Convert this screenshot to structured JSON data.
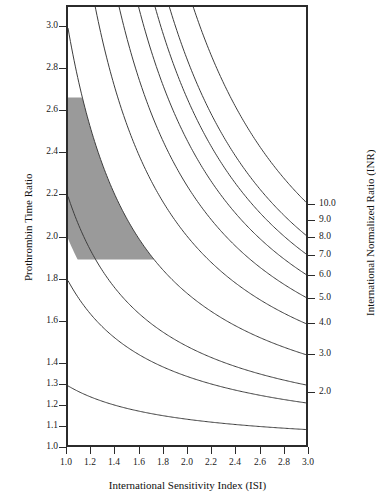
{
  "chart_data": {
    "type": "line",
    "title": "",
    "xlabel": "International Sensitivity Index (ISI)",
    "ylabel": "Prothrombin Time Ratio",
    "y2label": "International Normalized Ratio (INR)",
    "xlim": [
      1.0,
      3.0
    ],
    "ylim": [
      1.0,
      3.1
    ],
    "grid": false,
    "legend": "none",
    "x_ticks": [
      "1.0",
      "1.2",
      "1.4",
      "1.6",
      "1.8",
      "2.0",
      "2.2",
      "2.4",
      "2.6",
      "2.8",
      "3.0"
    ],
    "x_tick_values": [
      1.0,
      1.2,
      1.4,
      1.6,
      1.8,
      2.0,
      2.2,
      2.4,
      2.6,
      2.8,
      3.0
    ],
    "y_ticks": [
      "1.0",
      "1.1",
      "1.2",
      "1.3",
      "1.4",
      "1.6",
      "1.8",
      "2.0",
      "2.2",
      "2.4",
      "2.6",
      "2.8",
      "3.0"
    ],
    "y_tick_values": [
      1.0,
      1.1,
      1.2,
      1.3,
      1.4,
      1.6,
      1.8,
      2.0,
      2.2,
      2.4,
      2.6,
      2.8,
      3.0
    ],
    "y2_ticks": [
      "2.0",
      "3.0",
      "4.0",
      "5.0",
      "6.0",
      "7.0",
      "8.0",
      "9.0",
      "10.0"
    ],
    "y2_tick_inr": [
      2.0,
      3.0,
      4.0,
      5.0,
      6.0,
      7.0,
      8.0,
      9.0,
      10.0
    ],
    "relation": "PT ratio = INR^(1/ISI)",
    "series": [
      {
        "name": "INR 1.3",
        "inr": 1.3,
        "y_at_isi_1.0": 1.3,
        "y_at_isi_3.0": 1.09
      },
      {
        "name": "INR 1.8",
        "inr": 1.8,
        "y_at_isi_1.0": 1.8,
        "y_at_isi_3.0": 1.22
      },
      {
        "name": "INR 2.2",
        "inr": 2.2,
        "y_at_isi_1.0": 2.2,
        "y_at_isi_3.0": 1.3
      },
      {
        "name": "INR 3.0",
        "inr": 3.0,
        "y_at_isi_1.0": 3.0,
        "y_at_isi_3.0": 1.44
      },
      {
        "name": "INR 4.0",
        "inr": 4.0,
        "y_at_isi_1.0": 4.0,
        "y_at_isi_3.0": 1.59
      },
      {
        "name": "INR 5.0",
        "inr": 5.0,
        "y_at_isi_1.0": 5.0,
        "y_at_isi_3.0": 1.71
      },
      {
        "name": "INR 6.0",
        "inr": 6.0,
        "y_at_isi_1.0": 6.0,
        "y_at_isi_3.0": 1.82
      },
      {
        "name": "INR 7.0",
        "inr": 7.0,
        "y_at_isi_1.0": 7.0,
        "y_at_isi_3.0": 1.91
      },
      {
        "name": "INR 8.0",
        "inr": 8.0,
        "y_at_isi_1.0": 8.0,
        "y_at_isi_3.0": 2.0
      },
      {
        "name": "INR 10.0",
        "inr": 10.0,
        "y_at_isi_1.0": 10.0,
        "y_at_isi_3.0": 2.15
      }
    ],
    "shaded_band": {
      "label": "therapeutic range",
      "inr_low": 2.0,
      "inr_high": 3.0,
      "clip_pt_ratio_low": 1.9,
      "clip_pt_ratio_high": 2.67,
      "color": "#9a9a9a"
    },
    "line_color": "#3d3d3d",
    "frame_color": "#2b2b2b"
  }
}
